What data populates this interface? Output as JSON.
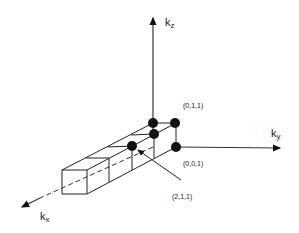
{
  "diagram": {
    "axes": {
      "kz": {
        "label": "k",
        "sub": "z"
      },
      "ky": {
        "label": "k",
        "sub": "y"
      },
      "kx": {
        "label": "k",
        "sub": "x"
      }
    },
    "points": [
      {
        "label": "(0,1,1)"
      },
      {
        "label": "(0,0,1)"
      },
      {
        "label": "(2,1,1)"
      }
    ],
    "colors": {
      "ink": "#111111",
      "background": "#ffffff"
    }
  }
}
